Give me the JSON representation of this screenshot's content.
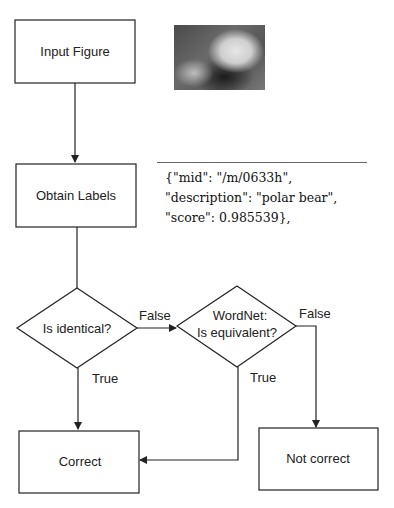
{
  "nodes": {
    "input_figure": "Input Figure",
    "obtain_labels": "Obtain Labels",
    "is_identical": "Is identical?",
    "wordnet_line1": "WordNet:",
    "wordnet_line2": "Is equivalent?",
    "correct": "Correct",
    "not_correct": "Not correct"
  },
  "edges": {
    "identical_false": "False",
    "identical_true": "True",
    "wordnet_false": "False",
    "wordnet_true": "True"
  },
  "image": {
    "alt": "polar bear photo"
  },
  "label_output": {
    "line1": "{\"mid\": \"/m/0633h\",",
    "line2": "\"description\": \"polar bear\",",
    "line3": "\"score\": 0.985539},"
  },
  "colors": {
    "stroke": "#222222",
    "background": "#ffffff"
  }
}
